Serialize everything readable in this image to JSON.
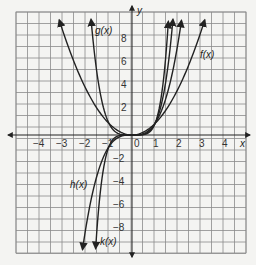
{
  "chart_data": {
    "type": "line",
    "title": "",
    "xlabel": "x",
    "ylabel": "y",
    "xlim": [
      -5,
      5
    ],
    "ylim": [
      -10,
      10
    ],
    "grid": true,
    "x_ticks": [
      -4,
      -3,
      -2,
      -1,
      0,
      1,
      2,
      3,
      4
    ],
    "y_ticks": [
      -8,
      -6,
      -4,
      -2,
      2,
      4,
      6,
      8
    ],
    "origin_label": "0",
    "series": [
      {
        "name": "f(x)",
        "label_text": "f(x)",
        "formula": "x^2",
        "x": [
          -3.16,
          -3,
          -2,
          -1,
          0,
          1,
          2,
          3,
          3.16
        ],
        "values": [
          10,
          9,
          4,
          1,
          0,
          1,
          4,
          9,
          10
        ]
      },
      {
        "name": "g(x)",
        "label_text": "g(x)",
        "formula": "x^4",
        "x": [
          -1.78,
          -1.5,
          -1,
          -0.5,
          0,
          0.5,
          1,
          1.5,
          1.78
        ],
        "values": [
          10,
          5.06,
          1,
          0.06,
          0,
          0.06,
          1,
          5.06,
          10
        ]
      },
      {
        "name": "h(x)",
        "label_text": "h(x)",
        "formula": "x^3",
        "x": [
          -2.15,
          -2,
          -1,
          0,
          1,
          2,
          2.15
        ],
        "values": [
          -10,
          -8,
          -1,
          0,
          1,
          8,
          10
        ]
      },
      {
        "name": "k(x)",
        "label_text": "k(x)",
        "formula": "x^5",
        "x": [
          -1.58,
          -1.5,
          -1,
          0,
          1,
          1.5,
          1.58
        ],
        "values": [
          -10,
          -7.59,
          -1,
          0,
          1,
          7.59,
          10
        ]
      }
    ],
    "legend": "inline labels"
  },
  "labels": {
    "x_axis": "x",
    "y_axis": "y",
    "origin": "0",
    "f": "f(x)",
    "g": "g(x)",
    "h": "h(x)",
    "k": "k(x)",
    "xt_m4": "−4",
    "xt_m3": "−3",
    "xt_m2": "−2",
    "xt_m1": "−1",
    "xt_1": "1",
    "xt_2": "2",
    "xt_3": "3",
    "xt_4": "4",
    "yt_8": "8",
    "yt_6": "6",
    "yt_4": "4",
    "yt_2": "2",
    "yt_m2": "−2",
    "yt_m4": "−4",
    "yt_m6": "−6",
    "yt_m8": "−8"
  },
  "colors": {
    "grid": "#8a8a8a",
    "curve": "#222222",
    "background": "#f4f4f2"
  }
}
